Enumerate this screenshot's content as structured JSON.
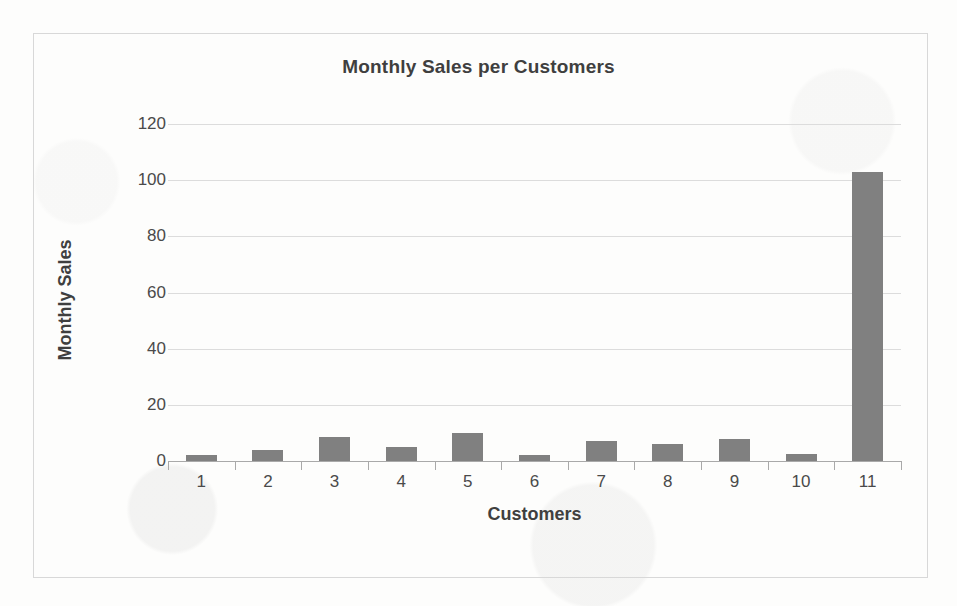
{
  "chart_data": {
    "type": "bar",
    "title": "Monthly Sales per Customers",
    "xlabel": "Customers",
    "ylabel": "Monthly Sales",
    "categories": [
      "1",
      "2",
      "3",
      "4",
      "5",
      "6",
      "7",
      "8",
      "9",
      "10",
      "11"
    ],
    "values": [
      2,
      4,
      8.5,
      5,
      10,
      2,
      7,
      6,
      8,
      2.5,
      103
    ],
    "ylim": [
      0,
      120
    ],
    "yticks": [
      "0",
      "20",
      "40",
      "60",
      "80",
      "100",
      "120"
    ],
    "ytick_values": [
      0,
      20,
      40,
      60,
      80,
      100,
      120
    ],
    "grid": true,
    "legend": false,
    "bar_color": "#808080",
    "gridline_color": "#dcdcdc",
    "axis_color": "#a9a9a9",
    "background_color": "#fdfdfc",
    "frame_color": "#d8d8d8"
  }
}
